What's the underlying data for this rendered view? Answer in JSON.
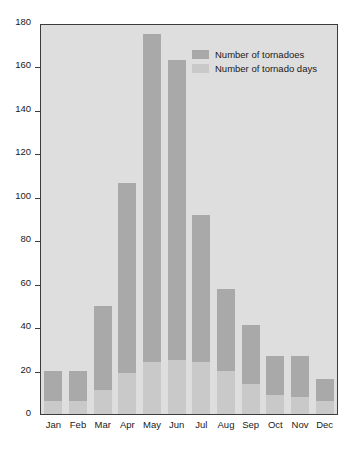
{
  "chart_data": {
    "type": "bar",
    "title": "",
    "subtitle": "",
    "xlabel": "",
    "ylabel": "",
    "categories": [
      "Jan",
      "Feb",
      "Mar",
      "Apr",
      "May",
      "Jun",
      "Jul",
      "Aug",
      "Sep",
      "Oct",
      "Nov",
      "Dec"
    ],
    "series": [
      {
        "name": "Number of tornadoes",
        "color": "#a9a9a9",
        "values": [
          20,
          20,
          50,
          107,
          176,
          164,
          92,
          58,
          41,
          27,
          27,
          16
        ]
      },
      {
        "name": "Number of tornado days",
        "color": "#c9c9c9",
        "values": [
          6,
          6,
          11,
          19,
          24,
          25,
          24,
          20,
          14,
          9,
          8,
          6
        ]
      }
    ],
    "stacked_overlay": true,
    "ylim": [
      0,
      180
    ],
    "ytick_step": 20,
    "yticks": [
      0,
      20,
      40,
      60,
      80,
      100,
      120,
      140,
      160,
      180
    ],
    "ytick_labels": [
      "0",
      "20",
      "40",
      "60",
      "80",
      "100",
      "120",
      "140",
      "160",
      "180"
    ],
    "grid": false,
    "legend_position": "top-right",
    "plot_background": "#dedede",
    "axis_color": "#3c3c3c"
  },
  "legend": {
    "items": [
      {
        "label": "Number of tornadoes"
      },
      {
        "label": "Number of tornado days"
      }
    ]
  }
}
